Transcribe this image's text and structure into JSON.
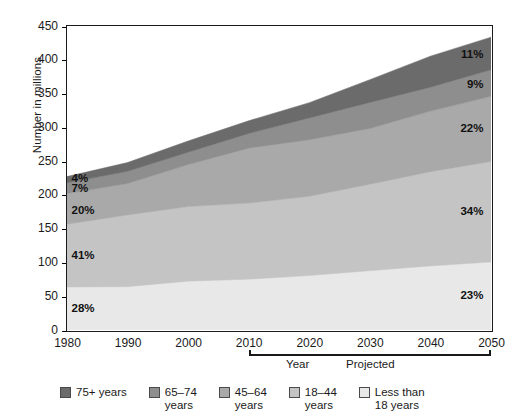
{
  "chart_data": {
    "type": "area",
    "title": "",
    "xlabel": "Year",
    "ylabel": "Number in millions",
    "x": [
      1980,
      1990,
      2000,
      2010,
      2020,
      2030,
      2040,
      2050
    ],
    "xlim": [
      1980,
      2050
    ],
    "ylim": [
      0,
      450
    ],
    "ytick_labels": [
      "0",
      "50",
      "100",
      "150",
      "200",
      "250",
      "300",
      "350",
      "400",
      "450"
    ],
    "ytick_values": [
      0,
      50,
      100,
      150,
      200,
      250,
      300,
      350,
      400,
      450
    ],
    "xtick_labels": [
      "1980",
      "1990",
      "2000",
      "2010",
      "2020",
      "2030",
      "2040",
      "2050"
    ],
    "grid": false,
    "stacked": true,
    "legend_position": "bottom",
    "projected_label": "Projected",
    "projected_range": [
      2010,
      2050
    ],
    "series": [
      {
        "name": "Less than 18 years",
        "color": "#e8e8e8",
        "values": [
          63.7,
          64.2,
          72.3,
          75.2,
          80.6,
          87.8,
          94.9,
          100.7
        ],
        "start_pct_label": "28%",
        "end_pct_label": "23%"
      },
      {
        "name": "18–44 years",
        "color": "#c4c4c4",
        "values": [
          93.0,
          106.2,
          110.5,
          112.8,
          117.4,
          128.0,
          139.5,
          148.9
        ],
        "start_pct_label": "41%",
        "end_pct_label": "34%"
      },
      {
        "name": "45–64 years",
        "color": "#a9a9a9",
        "values": [
          45.4,
          46.4,
          62.0,
          81.2,
          83.7,
          82.5,
          89.6,
          96.3
        ],
        "start_pct_label": "20%",
        "end_pct_label": "22%"
      },
      {
        "name": "65–74 years",
        "color": "#8e8e8e",
        "values": [
          15.9,
          18.1,
          18.4,
          21.7,
          32.3,
          38.6,
          35.4,
          39.4
        ],
        "start_pct_label": "7%",
        "end_pct_label": "9%"
      },
      {
        "name": "75+ years",
        "color": "#6b6b6b",
        "values": [
          9.1,
          13.0,
          16.6,
          18.8,
          22.5,
          33.7,
          46.0,
          48.2
        ],
        "start_pct_label": "4%",
        "end_pct_label": "11%"
      }
    ],
    "totals": [
      227.1,
      247.9,
      279.8,
      309.7,
      336.5,
      370.6,
      405.4,
      433.5
    ]
  },
  "axes": {
    "y_title": "Number in millions",
    "x_title": "Year"
  },
  "legend": {
    "items": [
      {
        "label": "75+ years",
        "color": "#6b6b6b"
      },
      {
        "label": "65–74\nyears",
        "color": "#8e8e8e"
      },
      {
        "label": "45–64\nyears",
        "color": "#a9a9a9"
      },
      {
        "label": "18–44\nyears",
        "color": "#c4c4c4"
      },
      {
        "label": "Less than\n18 years",
        "color": "#e8e8e8"
      }
    ]
  },
  "labels_left": [
    "4%",
    "7%",
    "20%",
    "41%",
    "28%"
  ],
  "labels_right": [
    "11%",
    "9%",
    "22%",
    "34%",
    "23%"
  ],
  "source_note": "d\ns\n-\n&"
}
